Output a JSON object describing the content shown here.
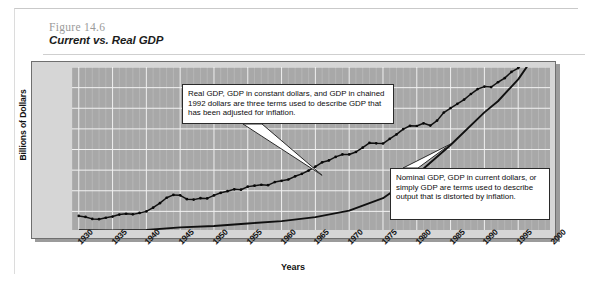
{
  "figure": {
    "number": "Figure 14.6",
    "title": "Current vs. Real GDP"
  },
  "callouts": [
    {
      "id": "real-gdp",
      "text": "Real GDP, GDP in constant dollars, and GDP in chained 1992 dollars are three terms used to describe GDP that has been adjusted for inflation."
    },
    {
      "id": "nominal-gdp",
      "text": "Nominal GDP, GDP in current dollars, or simply GDP are terms used to describe output that is distorted by inflation."
    }
  ],
  "chart_data": {
    "type": "line",
    "title": "Current vs. Real GDP",
    "xlabel": "Years",
    "ylabel": "Billions of Dollars",
    "xlim": [
      1929,
      2000
    ],
    "ylim": [
      0,
      8000
    ],
    "ytick_labels": [
      "$8,000",
      "7,000",
      "6,000",
      "5,000",
      "4,000",
      "3,000",
      "2,000",
      "1,000",
      "0"
    ],
    "ytick_values": [
      8000,
      7000,
      6000,
      5000,
      4000,
      3000,
      2000,
      1000,
      0
    ],
    "xtick_labels": [
      "1930",
      "1935",
      "1940",
      "1945",
      "1950",
      "1955",
      "1960",
      "1965",
      "1970",
      "1975",
      "1980",
      "1985",
      "1990",
      "1995",
      "2000"
    ],
    "xtick_values": [
      1930,
      1935,
      1940,
      1945,
      1950,
      1955,
      1960,
      1965,
      1970,
      1975,
      1980,
      1985,
      1990,
      1995,
      2000
    ],
    "grid": true,
    "legend": "none",
    "series": [
      {
        "name": "Real GDP (chained 1992 dollars)",
        "style": "dotted-markers",
        "x": [
          1930,
          1931,
          1932,
          1933,
          1934,
          1935,
          1936,
          1937,
          1938,
          1939,
          1940,
          1941,
          1942,
          1943,
          1944,
          1945,
          1946,
          1947,
          1948,
          1949,
          1950,
          1951,
          1952,
          1953,
          1954,
          1955,
          1956,
          1957,
          1958,
          1959,
          1960,
          1961,
          1962,
          1963,
          1964,
          1965,
          1966,
          1967,
          1968,
          1969,
          1970,
          1971,
          1972,
          1973,
          1974,
          1975,
          1976,
          1977,
          1978,
          1979,
          1980,
          1981,
          1982,
          1983,
          1984,
          1985,
          1986,
          1987,
          1988,
          1989,
          1990,
          1991,
          1992,
          1993,
          1994,
          1995,
          1996,
          1997,
          1998,
          1999
        ],
        "values": [
          780,
          730,
          635,
          620,
          690,
          750,
          845,
          885,
          855,
          925,
          1000,
          1180,
          1400,
          1660,
          1800,
          1780,
          1590,
          1570,
          1640,
          1630,
          1775,
          1900,
          1980,
          2070,
          2050,
          2200,
          2245,
          2290,
          2270,
          2420,
          2480,
          2545,
          2700,
          2820,
          2980,
          3170,
          3380,
          3470,
          3640,
          3760,
          3760,
          3880,
          4090,
          4320,
          4300,
          4290,
          4520,
          4730,
          4990,
          5150,
          5140,
          5270,
          5160,
          5400,
          5790,
          6010,
          6215,
          6420,
          6690,
          6930,
          7050,
          7025,
          7260,
          7460,
          7760,
          7950,
          8250,
          8600,
          9000,
          9350
        ]
      },
      {
        "name": "Nominal GDP (current dollars)",
        "style": "solid",
        "x": [
          1930,
          1935,
          1940,
          1945,
          1950,
          1955,
          1960,
          1965,
          1970,
          1975,
          1980,
          1985,
          1990,
          1992,
          1995,
          1999
        ],
        "values": [
          92,
          73,
          101,
          223,
          294,
          415,
          527,
          720,
          1039,
          1638,
          2790,
          4220,
          5800,
          6340,
          7400,
          9300
        ]
      }
    ],
    "annotations": [
      {
        "text": "Real GDP callout pointer",
        "points_to_year": 1966,
        "points_to_value": 2700
      },
      {
        "text": "Nominal GDP callout pointer",
        "points_to_year": 1985,
        "points_to_value": 4220
      }
    ],
    "crossover_year": 1992,
    "note": "Both series plotted on same axis; nominal GDP overtakes real GDP near 1992."
  }
}
